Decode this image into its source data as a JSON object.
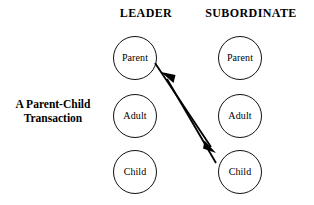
{
  "diagram": {
    "caption": {
      "line1": "A Parent-Child",
      "line2": "Transaction"
    },
    "columns": [
      {
        "id": "leader",
        "header": "LEADER",
        "ego_states": [
          {
            "id": "parent",
            "label": "Parent"
          },
          {
            "id": "adult",
            "label": "Adult"
          },
          {
            "id": "child",
            "label": "Child"
          }
        ]
      },
      {
        "id": "subordinate",
        "header": "SUBORDINATE",
        "ego_states": [
          {
            "id": "parent",
            "label": "Parent"
          },
          {
            "id": "adult",
            "label": "Adult"
          },
          {
            "id": "child",
            "label": "Child"
          }
        ]
      }
    ],
    "arrows": [
      {
        "id": "stimulus",
        "from": "leader.parent",
        "to": "subordinate.child",
        "direction": "down-right",
        "style": "solid-single-head"
      },
      {
        "id": "response",
        "from": "subordinate.child",
        "to": "leader.parent",
        "direction": "up-left",
        "style": "solid-single-head"
      }
    ],
    "colors": {
      "background": "#ffffff",
      "ink": "#111111",
      "stroke": "#000000"
    }
  }
}
